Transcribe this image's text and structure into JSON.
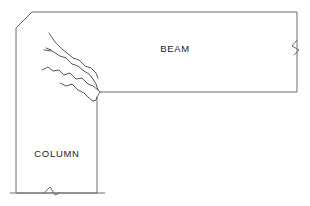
{
  "diagram": {
    "type": "structural-engineering-sketch",
    "background_color": "#ffffff",
    "line_color": "#6e6e6e",
    "crack_color": "#575757",
    "text_color": "#1c1c1c",
    "labels": {
      "beam": "BEAM",
      "column": "COLUMN"
    },
    "label_positions": {
      "beam": {
        "x": 175,
        "y": 52
      },
      "column": {
        "x": 57,
        "y": 157
      }
    },
    "geometry": {
      "outline_points": "32,12 297,12 297,92 100,92 97,97 97,193 16,193 16,28 32,12",
      "top_edge": {
        "x1": 32,
        "y1": 12,
        "x2": 297,
        "y2": 12
      },
      "right_edge": {
        "x1": 297,
        "y1": 12,
        "x2": 297,
        "y2": 92
      },
      "beam_soffit_edge": {
        "x1": 100,
        "y1": 92,
        "x2": 297,
        "y2": 92
      },
      "column_right_edge": {
        "x1": 97,
        "y1": 97,
        "x2": 97,
        "y2": 193
      },
      "column_base_edge": {
        "x1": 10,
        "y1": 193,
        "x2": 105,
        "y2": 193
      },
      "left_edge": {
        "x1": 16,
        "y1": 28,
        "x2": 16,
        "y2": 193
      },
      "chamfer_edge": {
        "x1": 16,
        "y1": 28,
        "x2": 32,
        "y2": 12
      },
      "reentrant_corner": {
        "x": 98,
        "y": 94
      }
    },
    "break_symbols": [
      {
        "name": "beam-break-symbol",
        "orientation": "vertical",
        "path": "M 297 40 L 292 46 L 299 50 L 294 55"
      },
      {
        "name": "column-break-symbol",
        "orientation": "horizontal",
        "path": "M 44 193 L 50 187 L 55 195 L 60 193"
      }
    ],
    "cracks": [
      {
        "name": "crack-1-upper-diagonal",
        "path": "M 49 33 L 55 42 L 62 49 L 67 53"
      },
      {
        "name": "crack-2-branch-upper",
        "path": "M 44 50 L 52 51 L 60 56 L 66 58 L 72 64 L 78 66 L 84 71"
      },
      {
        "name": "crack-3-mid-fork",
        "path": "M 67 53 L 73 58 L 79 60 L 85 66 L 91 68 L 96 73 L 98 78"
      },
      {
        "name": "crack-4-lower-left-branch",
        "path": "M 42 70 L 48 67 L 53 71 L 59 70 L 64 75 L 70 73 L 76 79 L 82 78 L 88 84"
      },
      {
        "name": "crack-5-to-corner-upper",
        "path": "M 84 71 L 89 74 L 93 79 L 96 84 L 98 90"
      },
      {
        "name": "crack-6-to-corner-lower",
        "path": "M 88 84 L 93 86 L 98 90"
      },
      {
        "name": "crack-7-lower-diagonal",
        "path": "M 60 83 L 66 86 L 72 84 L 78 90 L 84 93 L 89 98 L 93 101"
      },
      {
        "name": "crack-8-column-face",
        "path": "M 93 101 L 96 100 L 97 97"
      },
      {
        "name": "crack-9-corner-spur",
        "path": "M 98 90 L 100 92"
      },
      {
        "name": "crack-10-short-upper-tick",
        "path": "M 46 48 L 51 50"
      }
    ]
  }
}
